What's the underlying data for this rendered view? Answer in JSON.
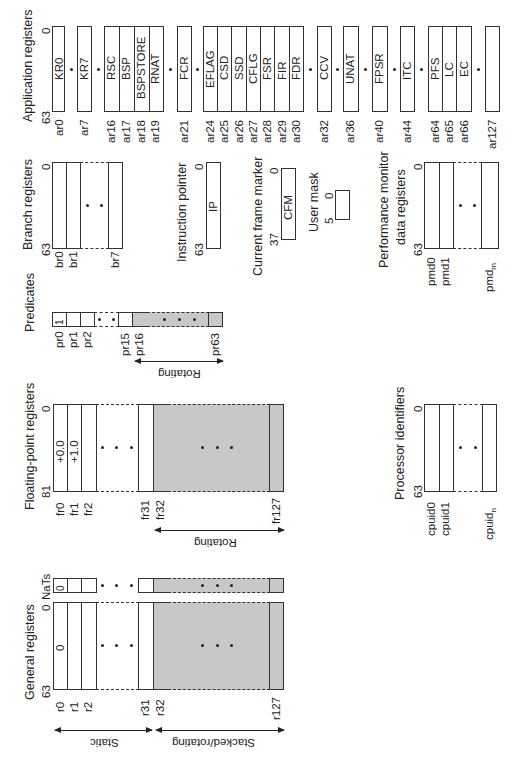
{
  "orientation": "rotated 90 degrees counter-clockwise (text reads bottom-to-top)",
  "general_registers": {
    "title": "General registers",
    "bit_high": "63",
    "bit_low": "0",
    "nat_label": "NaTs",
    "nat_r0_value": "0",
    "r0_value": "0",
    "labels": {
      "r0": "r0",
      "r1": "r1",
      "r2": "r2",
      "r31": "r31",
      "r32": "r32",
      "r127": "r127"
    },
    "static_label": "Static",
    "stacked_label": "Stacked/rotating"
  },
  "fp_registers": {
    "title": "Floating-point registers",
    "bit_high": "81",
    "bit_low": "0",
    "fr0_value": "+0.0",
    "fr1_value": "+1.0",
    "labels": {
      "fr0": "fr0",
      "fr1": "fr1",
      "fr2": "fr2",
      "fr31": "fr31",
      "fr32": "fr32",
      "fr127": "fr127"
    },
    "rotating_label": "Rotating"
  },
  "predicates": {
    "title": "Predicates",
    "pr0_value": "1",
    "labels": {
      "pr0": "pr0",
      "pr1": "pr1",
      "pr2": "pr2",
      "pr15": "pr15",
      "pr16": "pr16",
      "pr63": "pr63"
    },
    "rotating_label": "Rotating"
  },
  "branch_registers": {
    "title": "Branch registers",
    "bit_high": "63",
    "bit_low": "0",
    "labels": {
      "br0": "br0",
      "br1": "br1",
      "br7": "br7"
    }
  },
  "instruction_pointer": {
    "title": "Instruction pointer",
    "bit_high": "63",
    "bit_low": "0",
    "value": "IP"
  },
  "current_frame_marker": {
    "title": "Current frame marker",
    "bit_high": "37",
    "bit_low": "0",
    "value": "CFM"
  },
  "user_mask": {
    "title": "User mask",
    "bit_high": "5",
    "bit_low": "0"
  },
  "performance_monitor": {
    "title_line1": "Performance monitor",
    "title_line2": "data registers",
    "bit_high": "63",
    "bit_low": "0",
    "labels": {
      "pmd0": "pmd0",
      "pmd1": "pmd1",
      "pmdm": "pmd",
      "pmdm_sub": "m"
    }
  },
  "processor_identifiers": {
    "title": "Processor identifiers",
    "bit_high": "63",
    "bit_low": "0",
    "labels": {
      "cpuid0": "cpuid0",
      "cpuid1": "cpuid1",
      "cpuidn": "cpuid",
      "cpuidn_sub": "n"
    }
  },
  "application_registers": {
    "title": "Application registers",
    "bit_high": "63",
    "bit_low": "0",
    "groups": [
      {
        "regs": [
          {
            "id": "ar0",
            "name": "KR0"
          }
        ]
      },
      {
        "regs": [
          {
            "id": "ar7",
            "name": "KR7"
          }
        ]
      },
      {
        "regs": [
          {
            "id": "ar16",
            "name": "RSC"
          },
          {
            "id": "ar17",
            "name": "BSP"
          },
          {
            "id": "ar18",
            "name": "BSPSTORE"
          },
          {
            "id": "ar19",
            "name": "RNAT"
          }
        ]
      },
      {
        "regs": [
          {
            "id": "ar21",
            "name": "FCR"
          }
        ]
      },
      {
        "regs": [
          {
            "id": "ar24",
            "name": "EFLAG"
          },
          {
            "id": "ar25",
            "name": "CSD"
          },
          {
            "id": "ar26",
            "name": "SSD"
          },
          {
            "id": "ar27",
            "name": "CFLG"
          },
          {
            "id": "ar28",
            "name": "FSR"
          },
          {
            "id": "ar29",
            "name": "FIR"
          },
          {
            "id": "ar30",
            "name": "FDR"
          }
        ]
      },
      {
        "regs": [
          {
            "id": "ar32",
            "name": "CCV"
          }
        ]
      },
      {
        "regs": [
          {
            "id": "ar36",
            "name": "UNAT"
          }
        ]
      },
      {
        "regs": [
          {
            "id": "ar40",
            "name": "FPSR"
          }
        ]
      },
      {
        "regs": [
          {
            "id": "ar44",
            "name": "ITC"
          }
        ]
      },
      {
        "regs": [
          {
            "id": "ar64",
            "name": "PFS"
          },
          {
            "id": "ar65",
            "name": "LC"
          },
          {
            "id": "ar66",
            "name": "EC"
          }
        ]
      },
      {
        "regs": [
          {
            "id": "ar127",
            "name": ""
          }
        ]
      }
    ]
  },
  "colors": {
    "line": "#333333",
    "shaded_rotating": "#c8c8c8",
    "background": "#ffffff"
  }
}
